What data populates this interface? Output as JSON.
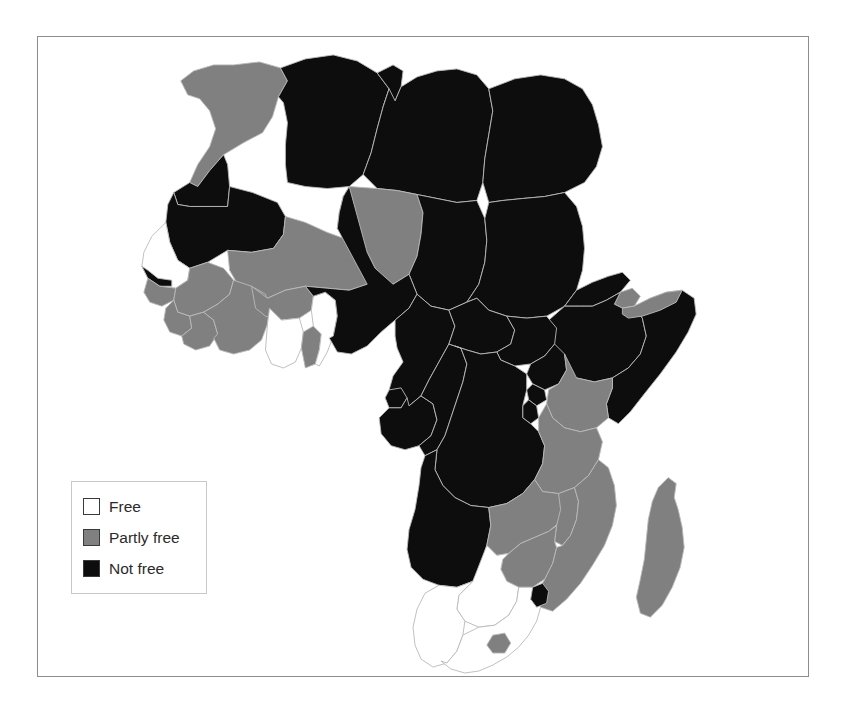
{
  "figure": {
    "caption": ""
  },
  "legend": {
    "items": [
      {
        "label": "Free",
        "color": "#ffffff",
        "key": "free"
      },
      {
        "label": "Partly free",
        "color": "#808080",
        "key": "partly_free"
      },
      {
        "label": "Not free",
        "color": "#0d0d0d",
        "key": "not_free"
      }
    ]
  },
  "colors": {
    "free": "#ffffff",
    "partly_free": "#808080",
    "not_free": "#0d0d0d",
    "border": "#b9b9b9",
    "frame": "#8d8d8d"
  },
  "chart_data": {
    "type": "map",
    "categories": [
      "Free",
      "Partly free",
      "Not free"
    ],
    "legend_position": "bottom-left",
    "regions": [
      {
        "name": "Morocco",
        "status": "partly_free"
      },
      {
        "name": "Western Sahara",
        "status": "not_free"
      },
      {
        "name": "Algeria",
        "status": "not_free"
      },
      {
        "name": "Tunisia",
        "status": "not_free"
      },
      {
        "name": "Libya",
        "status": "not_free"
      },
      {
        "name": "Egypt",
        "status": "not_free"
      },
      {
        "name": "Mauritania",
        "status": "not_free"
      },
      {
        "name": "Mali",
        "status": "partly_free"
      },
      {
        "name": "Niger",
        "status": "partly_free"
      },
      {
        "name": "Chad",
        "status": "not_free"
      },
      {
        "name": "Sudan",
        "status": "not_free"
      },
      {
        "name": "Eritrea",
        "status": "not_free"
      },
      {
        "name": "Djibouti",
        "status": "partly_free"
      },
      {
        "name": "Ethiopia",
        "status": "not_free"
      },
      {
        "name": "Somalia",
        "status": "not_free"
      },
      {
        "name": "Somaliland",
        "status": "partly_free"
      },
      {
        "name": "Senegal",
        "status": "free"
      },
      {
        "name": "Gambia",
        "status": "not_free"
      },
      {
        "name": "Guinea-Bissau",
        "status": "partly_free"
      },
      {
        "name": "Guinea",
        "status": "partly_free"
      },
      {
        "name": "Sierra Leone",
        "status": "partly_free"
      },
      {
        "name": "Liberia",
        "status": "partly_free"
      },
      {
        "name": "Cote d'Ivoire",
        "status": "partly_free"
      },
      {
        "name": "Burkina Faso",
        "status": "partly_free"
      },
      {
        "name": "Ghana",
        "status": "free"
      },
      {
        "name": "Togo",
        "status": "partly_free"
      },
      {
        "name": "Benin",
        "status": "free"
      },
      {
        "name": "Nigeria",
        "status": "not_free"
      },
      {
        "name": "Cameroon",
        "status": "not_free"
      },
      {
        "name": "Equatorial Guinea",
        "status": "not_free"
      },
      {
        "name": "Gabon",
        "status": "not_free"
      },
      {
        "name": "Republic of the Congo",
        "status": "not_free"
      },
      {
        "name": "Central African Republic",
        "status": "not_free"
      },
      {
        "name": "South Sudan",
        "status": "not_free"
      },
      {
        "name": "Uganda",
        "status": "not_free"
      },
      {
        "name": "Kenya",
        "status": "partly_free"
      },
      {
        "name": "Rwanda",
        "status": "not_free"
      },
      {
        "name": "Burundi",
        "status": "not_free"
      },
      {
        "name": "Democratic Republic of the Congo",
        "status": "not_free"
      },
      {
        "name": "Tanzania",
        "status": "partly_free"
      },
      {
        "name": "Angola",
        "status": "not_free"
      },
      {
        "name": "Zambia",
        "status": "partly_free"
      },
      {
        "name": "Malawi",
        "status": "partly_free"
      },
      {
        "name": "Mozambique",
        "status": "partly_free"
      },
      {
        "name": "Zimbabwe",
        "status": "partly_free"
      },
      {
        "name": "Botswana",
        "status": "free"
      },
      {
        "name": "Namibia",
        "status": "free"
      },
      {
        "name": "South Africa",
        "status": "free"
      },
      {
        "name": "Lesotho",
        "status": "partly_free"
      },
      {
        "name": "Swaziland",
        "status": "not_free"
      },
      {
        "name": "Madagascar",
        "status": "partly_free"
      }
    ],
    "counts": {
      "free": 6,
      "partly_free": 19,
      "not_free": 26
    }
  },
  "geometry": {
    "viewbox": "0 0 772 641",
    "shapes": [
      {
        "name": "Morocco",
        "status": "partly_free",
        "d": "M196 28 L222 25 L243 31 L250 44 L241 60 L235 80 L225 96 L206 106 L186 118 L172 134 L160 150 L152 146 L160 128 L172 110 L178 92 L172 74 L162 62 L150 58 L143 44 L156 34 L176 28 Z"
      },
      {
        "name": "Western Sahara",
        "status": "not_free",
        "d": "M152 146 L160 150 L172 134 L186 118 L190 128 L192 150 L190 170 L152 170 L140 168 L136 156 Z"
      },
      {
        "name": "Mauritania",
        "status": "not_free",
        "d": "M136 156 L140 168 L152 170 L190 170 L192 150 L215 156 L240 166 L248 180 L246 198 L236 212 L214 216 L190 214 L170 226 L152 232 L140 224 L132 206 L128 186 L130 168 Z"
      },
      {
        "name": "Algeria",
        "status": "not_free",
        "d": "M243 31 L268 22 L296 18 L320 24 L340 36 L352 52 L346 70 L340 92 L334 116 L326 138 L312 150 L290 152 L268 150 L250 146 L248 128 L248 108 L250 86 L246 66 L241 60 L250 44 Z"
      },
      {
        "name": "Tunisia",
        "status": "not_free",
        "d": "M340 36 L356 28 L366 34 L364 50 L358 64 L352 70 L346 70 L352 52 Z"
      },
      {
        "name": "Libya",
        "status": "not_free",
        "d": "M352 52 L358 64 L364 50 L380 40 L400 34 L420 32 L440 38 L452 52 L456 74 L452 98 L448 122 L446 146 L440 164 L420 166 L400 162 L380 158 L360 154 L340 152 L326 138 L334 116 L340 92 L346 70 Z"
      },
      {
        "name": "Egypt",
        "status": "not_free",
        "d": "M452 52 L478 42 L504 38 L528 42 L546 52 L556 68 L562 88 L566 110 L560 130 L548 146 L528 156 L508 160 L486 162 L466 164 L452 166 L446 146 L448 122 L452 98 L456 74 Z"
      },
      {
        "name": "Mali",
        "status": "partly_free",
        "d": "M190 214 L214 216 L236 212 L246 198 L248 180 L268 186 L290 196 L312 204 L330 216 L338 232 L330 248 L312 254 L290 252 L268 250 L248 254 L230 262 L214 258 L200 248 L192 234 Z"
      },
      {
        "name": "Niger",
        "status": "partly_free",
        "d": "M312 150 L340 152 L360 154 L380 158 L386 176 L384 198 L380 220 L372 238 L356 248 L338 246 L330 248 L338 232 L330 216 L312 204 L300 192 L302 176 L306 160 Z"
      },
      {
        "name": "Chad",
        "status": "not_free",
        "d": "M380 158 L400 162 L420 166 L440 164 L448 182 L450 204 L448 226 L442 248 L430 266 L412 274 L394 270 L380 258 L372 238 L380 220 L384 198 L386 176 Z"
      },
      {
        "name": "Sudan",
        "status": "not_free",
        "d": "M452 166 L466 164 L486 162 L508 160 L528 156 L540 170 L546 190 L548 212 L546 234 L540 254 L528 270 L510 280 L490 282 L470 280 L452 274 L440 262 L430 266 L442 248 L448 226 L450 204 L448 182 Z"
      },
      {
        "name": "Eritrea",
        "status": "not_free",
        "d": "M540 254 L556 246 L572 240 L586 236 L594 244 L584 256 L570 264 L556 270 L544 270 L528 270 L540 254 Z"
      },
      {
        "name": "Djibouti",
        "status": "partly_free",
        "d": "M584 256 L596 252 L604 260 L598 270 L586 272 L578 268 Z"
      },
      {
        "name": "Ethiopia",
        "status": "not_free",
        "d": "M528 270 L544 270 L556 270 L570 264 L584 256 L578 268 L586 272 L598 270 L606 282 L610 300 L604 318 L592 332 L576 342 L558 346 L540 342 L524 334 L512 320 L506 302 L510 286 Z"
      },
      {
        "name": "Somalia",
        "status": "not_free",
        "d": "M598 270 L614 262 L630 256 L646 254 L658 262 L660 278 L652 296 L640 316 L624 338 L608 358 L594 376 L582 388 L572 382 L570 368 L576 352 L576 342 L592 332 L604 318 L610 300 L606 282 Z"
      },
      {
        "name": "Somaliland",
        "status": "partly_free",
        "d": "M586 272 L598 270 L614 262 L630 256 L646 254 L640 266 L624 274 L606 280 L592 282 L586 278 Z"
      },
      {
        "name": "Senegal",
        "status": "free",
        "d": "M128 186 L132 206 L140 224 L152 232 L150 244 L138 252 L122 250 L110 242 L104 230 L106 216 L114 200 Z"
      },
      {
        "name": "Gambia",
        "status": "not_free",
        "d": "M104 230 L110 242 L122 250 L134 250 L134 244 L120 242 L110 234 Z"
      },
      {
        "name": "Guinea-Bissau",
        "status": "partly_free",
        "d": "M110 242 L122 250 L138 252 L136 264 L124 270 L112 266 L106 256 Z"
      },
      {
        "name": "Guinea",
        "status": "partly_free",
        "d": "M138 252 L150 244 L152 232 L170 226 L186 232 L196 244 L192 258 L180 268 L166 276 L152 280 L140 276 L136 264 Z"
      },
      {
        "name": "Sierra Leone",
        "status": "partly_free",
        "d": "M136 264 L140 276 L152 280 L154 292 L144 300 L132 296 L126 284 L128 272 Z"
      },
      {
        "name": "Liberia",
        "status": "partly_free",
        "d": "M152 280 L166 276 L176 284 L180 298 L172 310 L158 314 L146 308 L144 300 L154 292 Z"
      },
      {
        "name": "Cote d'Ivoire",
        "status": "partly_free",
        "d": "M180 268 L192 258 L196 244 L214 250 L228 258 L232 272 L230 288 L224 304 L212 314 L196 318 L182 314 L176 302 L180 298 L176 284 L166 276 Z"
      },
      {
        "name": "Burkina Faso",
        "status": "partly_free",
        "d": "M214 250 L230 262 L248 254 L268 250 L276 260 L274 274 L262 282 L244 284 L228 280 L218 272 Z"
      },
      {
        "name": "Ghana",
        "status": "free",
        "d": "M232 272 L244 284 L262 282 L266 296 L264 312 L258 326 L246 332 L234 328 L228 314 L230 288 Z"
      },
      {
        "name": "Togo",
        "status": "partly_free",
        "d": "M266 296 L276 290 L284 298 L282 314 L278 328 L268 332 L264 312 Z"
      },
      {
        "name": "Benin",
        "status": "free",
        "d": "M276 260 L288 256 L298 264 L300 280 L296 300 L290 316 L282 330 L278 328 L282 314 L284 298 L276 290 L274 274 Z"
      },
      {
        "name": "Nigeria",
        "status": "not_free",
        "d": "M300 192 L302 176 L306 160 L312 150 L330 216 L338 232 L356 248 L372 238 L380 258 L372 272 L358 284 L344 296 L330 310 L314 318 L300 316 L292 302 L296 300 L300 280 L298 264 L288 256 L276 260 L268 250 L290 252 L312 254 L330 248 Z"
      },
      {
        "name": "Cameroon",
        "status": "not_free",
        "d": "M380 258 L394 270 L412 274 L418 290 L412 308 L402 326 L392 344 L384 360 L372 370 L360 366 L352 354 L356 340 L366 326 L360 312 L358 300 L358 284 L372 272 Z"
      },
      {
        "name": "Equatorial Guinea",
        "status": "not_free",
        "d": "M352 354 L364 352 L370 362 L364 372 L352 372 L348 362 Z"
      },
      {
        "name": "Gabon",
        "status": "not_free",
        "d": "M352 372 L364 372 L370 362 L372 370 L384 360 L396 368 L400 384 L394 400 L382 410 L368 414 L354 410 L344 398 L342 382 Z"
      },
      {
        "name": "Republic of the Congo",
        "status": "not_free",
        "d": "M384 360 L392 344 L402 326 L412 308 L424 312 L430 328 L426 346 L420 364 L414 382 L408 400 L400 414 L388 420 L382 410 L394 400 L400 384 L396 368 Z"
      },
      {
        "name": "Central African Republic",
        "status": "not_free",
        "d": "M412 274 L430 266 L440 262 L452 274 L470 280 L478 294 L474 308 L460 316 L444 318 L430 314 L418 310 L412 308 L418 290 Z"
      },
      {
        "name": "South Sudan",
        "status": "not_free",
        "d": "M470 280 L490 282 L510 280 L520 292 L518 308 L508 320 L494 328 L478 330 L464 324 L460 316 L474 308 L478 294 Z"
      },
      {
        "name": "Uganda",
        "status": "not_free",
        "d": "M494 328 L508 320 L518 308 L528 318 L530 334 L522 348 L508 354 L496 348 L490 338 Z"
      },
      {
        "name": "Kenya",
        "status": "partly_free",
        "d": "M528 318 L540 342 L558 346 L576 342 L576 352 L570 368 L572 382 L560 392 L544 396 L528 392 L516 382 L510 368 L512 354 L522 348 L530 334 Z"
      },
      {
        "name": "Rwanda",
        "status": "not_free",
        "d": "M496 348 L508 354 L510 364 L500 370 L492 364 L490 354 Z"
      },
      {
        "name": "Burundi",
        "status": "not_free",
        "d": "M492 364 L500 370 L502 382 L494 388 L486 382 L486 370 Z"
      },
      {
        "name": "Democratic Republic of the Congo",
        "status": "not_free",
        "d": "M418 310 L430 314 L444 318 L460 316 L464 324 L478 330 L490 338 L490 354 L486 370 L486 382 L494 388 L502 396 L508 410 L506 428 L498 444 L486 458 L470 468 L452 472 L434 470 L418 462 L406 450 L398 434 L400 414 L408 400 L414 382 L420 364 L426 346 L430 328 L424 312 Z"
      },
      {
        "name": "Tanzania",
        "status": "partly_free",
        "d": "M502 382 L510 368 L516 382 L528 392 L544 396 L560 392 L566 406 L562 424 L552 440 L538 452 L522 458 L506 456 L498 444 L506 428 L508 410 L502 396 Z"
      },
      {
        "name": "Angola",
        "status": "not_free",
        "d": "M388 420 L400 414 L398 434 L406 450 L418 462 L434 470 L452 472 L454 490 L450 510 L444 530 L436 546 L420 552 L402 550 L386 544 L374 532 L370 514 L372 494 L378 474 L382 450 L384 432 Z"
      },
      {
        "name": "Zambia",
        "status": "partly_free",
        "d": "M452 472 L470 468 L486 458 L498 444 L506 456 L522 458 L528 470 L524 486 L512 496 L498 502 L484 508 L472 518 L460 520 L452 512 L450 510 L454 490 Z"
      },
      {
        "name": "Malawi",
        "status": "partly_free",
        "d": "M522 458 L538 452 L542 466 L540 484 L534 500 L526 510 L518 506 L520 490 L524 474 Z"
      },
      {
        "name": "Mozambique",
        "status": "partly_free",
        "d": "M538 452 L552 440 L562 424 L572 432 L578 450 L580 470 L576 490 L568 510 L556 530 L544 548 L530 564 L516 576 L504 572 L500 558 L508 544 L516 528 L520 512 L526 510 L534 500 L540 484 L542 466 Z"
      },
      {
        "name": "Zimbabwe",
        "status": "partly_free",
        "d": "M472 518 L484 508 L498 502 L512 496 L520 490 L518 506 L520 512 L516 528 L508 544 L496 552 L482 552 L470 546 L464 534 L466 524 Z"
      },
      {
        "name": "Botswana",
        "status": "free",
        "d": "M436 546 L450 510 L452 512 L460 520 L472 518 L466 524 L464 534 L470 546 L482 552 L480 566 L472 580 L458 590 L442 592 L428 586 L420 574 L422 560 Z"
      },
      {
        "name": "Namibia",
        "status": "free",
        "d": "M402 550 L420 552 L436 546 L422 560 L420 574 L428 586 L426 600 L420 616 L410 628 L396 632 L384 624 L378 610 L376 592 L380 574 L388 558 Z"
      },
      {
        "name": "South Africa",
        "status": "free",
        "d": "M426 600 L442 592 L458 590 L472 580 L480 566 L482 552 L496 552 L508 544 L500 558 L504 572 L500 586 L492 600 L482 612 L470 622 L456 630 L442 636 L428 638 L414 634 L404 626 L410 628 L420 616 Z"
      },
      {
        "name": "Lesotho",
        "status": "partly_free",
        "d": "M456 600 L468 598 L474 608 L468 618 L456 618 L450 610 Z"
      },
      {
        "name": "Swaziland",
        "status": "not_free",
        "d": "M496 552 L506 548 L512 556 L510 568 L500 572 L494 564 Z"
      },
      {
        "name": "Madagascar",
        "status": "partly_free",
        "d": "M622 452 L632 442 L640 448 L638 462 L642 474 L646 492 L648 512 L644 532 L636 552 L626 570 L614 582 L604 578 L600 562 L604 544 L608 524 L610 504 L612 484 L616 466 Z"
      }
    ]
  }
}
